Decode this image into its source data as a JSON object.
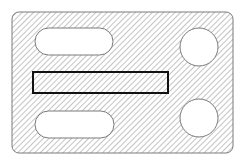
{
  "diagram": {
    "type": "hatched-plate-section",
    "colors": {
      "background": "#ffffff",
      "hatch": "#8a8a8a",
      "outline": "#7a7a7a",
      "highlight_outline": "#111111",
      "cutout_fill": "#ffffff"
    },
    "plate": {
      "x": 12,
      "y": 12,
      "width": 221,
      "height": 141,
      "corner_radius": 7
    },
    "hatch": {
      "angle_deg": 45,
      "spacing": 4,
      "stroke_width": 1
    },
    "slots": [
      {
        "name": "top-left-slot",
        "x": 35,
        "y": 28,
        "width": 78,
        "height": 27
      },
      {
        "name": "bottom-left-slot",
        "x": 35,
        "y": 111,
        "width": 79,
        "height": 27
      }
    ],
    "holes": [
      {
        "name": "top-right-hole",
        "cx": 199,
        "cy": 47,
        "r": 19
      },
      {
        "name": "bottom-right-hole",
        "cx": 199,
        "cy": 118,
        "r": 19
      }
    ],
    "highlight_rect": {
      "name": "center-bar",
      "x": 33,
      "y": 72,
      "width": 135,
      "height": 21,
      "stroke_width": 2
    }
  }
}
